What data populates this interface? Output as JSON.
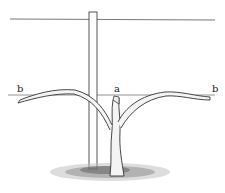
{
  "figure": {
    "labels": {
      "left_arm": "b",
      "spur": "a",
      "right_arm": "b"
    },
    "colors": {
      "ink": "#333333",
      "background": "#ffffff"
    }
  }
}
